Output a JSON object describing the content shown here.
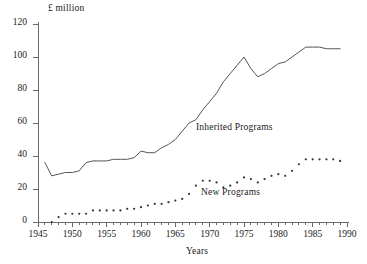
{
  "chart_data": {
    "type": "line",
    "title": "",
    "subtitle": "",
    "xlabel": "Years",
    "ylabel": "£ million",
    "xlim": [
      1945,
      1990
    ],
    "ylim": [
      0,
      120
    ],
    "grid": false,
    "legend_position": "inline-annotation",
    "x_major_ticks": [
      1945,
      1950,
      1955,
      1960,
      1965,
      1970,
      1975,
      1980,
      1985,
      1990
    ],
    "x_tick_labels": [
      "1945",
      "1950",
      "1955",
      "1960",
      "1965",
      "1970",
      "1975",
      "1980",
      "1985",
      "1990"
    ],
    "x_minor_tick_interval": 1,
    "y_major_ticks": [
      0,
      20,
      40,
      60,
      80,
      100,
      120
    ],
    "y_tick_labels": [
      "0",
      "20",
      "40",
      "60",
      "80",
      "100",
      "120"
    ],
    "annotations": [
      {
        "text": "Inherited Programs",
        "x": 1972,
        "y": 57
      },
      {
        "text": "New Programs",
        "x": 1973,
        "y": 18
      }
    ],
    "series": [
      {
        "name": "Inherited Programs",
        "style": "solid",
        "color": "#555555",
        "x": [
          1946,
          1947,
          1948,
          1949,
          1950,
          1951,
          1952,
          1953,
          1954,
          1955,
          1956,
          1957,
          1958,
          1959,
          1960,
          1961,
          1962,
          1963,
          1964,
          1965,
          1966,
          1967,
          1968,
          1969,
          1970,
          1971,
          1972,
          1973,
          1974,
          1975,
          1976,
          1977,
          1978,
          1979,
          1980,
          1981,
          1982,
          1983,
          1984,
          1985,
          1986,
          1987,
          1988,
          1989
        ],
        "values": [
          36,
          28,
          29,
          30,
          30,
          31,
          36,
          37,
          37,
          37,
          38,
          38,
          38,
          39,
          43,
          42,
          42,
          45,
          47,
          50,
          55,
          60,
          62,
          68,
          73,
          78,
          85,
          90,
          95,
          100,
          93,
          88,
          90,
          93,
          96,
          97,
          100,
          103,
          106,
          106,
          106,
          105,
          105,
          105
        ]
      },
      {
        "name": "New Programs",
        "style": "dotted",
        "color": "#333333",
        "x": [
          1947,
          1948,
          1949,
          1950,
          1951,
          1952,
          1953,
          1954,
          1955,
          1956,
          1957,
          1958,
          1959,
          1960,
          1961,
          1962,
          1963,
          1964,
          1965,
          1966,
          1967,
          1968,
          1969,
          1970,
          1971,
          1972,
          1973,
          1974,
          1975,
          1976,
          1977,
          1978,
          1979,
          1980,
          1981,
          1982,
          1983,
          1984,
          1985,
          1986,
          1987,
          1988,
          1989
        ],
        "values": [
          0,
          3,
          5,
          5,
          5,
          5,
          7,
          7,
          7,
          7,
          7,
          8,
          8,
          9,
          10,
          11,
          11,
          12,
          13,
          14,
          17,
          22,
          25,
          25,
          24,
          21,
          22,
          24,
          27,
          26,
          24,
          26,
          28,
          29,
          28,
          31,
          35,
          38,
          38,
          38,
          38,
          38,
          37
        ]
      }
    ]
  }
}
